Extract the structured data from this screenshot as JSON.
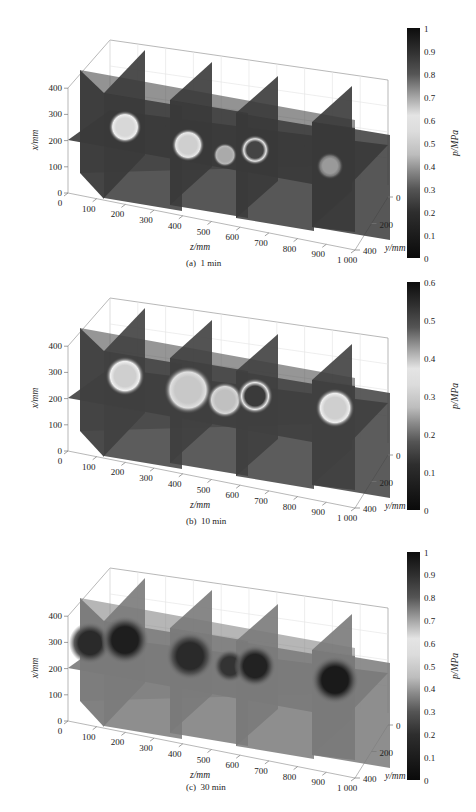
{
  "figure": {
    "panels": [
      {
        "id": "a",
        "caption_label": "(a)",
        "caption_time": "1 min",
        "top": 0,
        "colorbar": {
          "min": 0,
          "max": 1,
          "ticks": [
            "1",
            "0.9",
            "0.8",
            "0.7",
            "0.6",
            "0.5",
            "0.4",
            "0.3",
            "0.2",
            "0.1",
            "0"
          ],
          "label": "p/MPa"
        },
        "base_shade": "#3a3a3a",
        "hotspots": [
          {
            "cx": 125,
            "cy": 127,
            "r": 11,
            "core": "#d8d8d8",
            "rim": "#eeeeee"
          },
          {
            "cx": 188,
            "cy": 145,
            "r": 11,
            "core": "#cfcfcf",
            "rim": "#e8e8e8"
          },
          {
            "cx": 255,
            "cy": 150,
            "r": 10,
            "core": "#444444",
            "rim": "#e6e6e6"
          },
          {
            "cx": 225,
            "cy": 155,
            "r": 8,
            "core": "#aaaaaa",
            "rim": "#b8b8b8"
          },
          {
            "cx": 330,
            "cy": 166,
            "r": 9,
            "core": "#9a9a9a",
            "rim": "#777777"
          }
        ]
      },
      {
        "id": "b",
        "caption_label": "(b)",
        "caption_time": "10 min",
        "top": 270,
        "colorbar": {
          "min": 0,
          "max": 0.6,
          "ticks": [
            "0.6",
            "0.5",
            "0.4",
            "0.3",
            "0.2",
            "0.1",
            "0"
          ],
          "label": "p/MPa"
        },
        "base_shade": "#404040",
        "hotspots": [
          {
            "cx": 125,
            "cy": 118,
            "r": 13,
            "core": "#cfcfcf",
            "rim": "#f0f0f0"
          },
          {
            "cx": 188,
            "cy": 132,
            "r": 16,
            "core": "#c8c8c8",
            "rim": "#e0e0e0"
          },
          {
            "cx": 225,
            "cy": 142,
            "r": 12,
            "core": "#c0c0c0",
            "rim": "#d8d8d8"
          },
          {
            "cx": 255,
            "cy": 138,
            "r": 12,
            "core": "#3a3a3a",
            "rim": "#e8e8e8"
          },
          {
            "cx": 335,
            "cy": 150,
            "r": 13,
            "core": "#cfcfcf",
            "rim": "#eeeeee"
          }
        ]
      },
      {
        "id": "c",
        "caption_label": "(c)",
        "caption_time": "30 min",
        "top": 540,
        "colorbar": {
          "min": 0,
          "max": 1,
          "ticks": [
            "1",
            "0.9",
            "0.8",
            "0.7",
            "0.6",
            "0.5",
            "0.4",
            "0.3",
            "0.2",
            "0.1",
            "0"
          ],
          "label": "p/MPa"
        },
        "base_shade": "#7a7a7a",
        "hotspots": [
          {
            "cx": 90,
            "cy": 115,
            "r": 14,
            "core": "#2a2a2a",
            "rim": "#5a5a5a"
          },
          {
            "cx": 125,
            "cy": 112,
            "r": 16,
            "core": "#1e1e1e",
            "rim": "#555555"
          },
          {
            "cx": 190,
            "cy": 128,
            "r": 16,
            "core": "#2a2a2a",
            "rim": "#555555"
          },
          {
            "cx": 230,
            "cy": 138,
            "r": 11,
            "core": "#333333",
            "rim": "#5a5a5a"
          },
          {
            "cx": 255,
            "cy": 138,
            "r": 14,
            "core": "#222222",
            "rim": "#555555"
          },
          {
            "cx": 335,
            "cy": 152,
            "r": 16,
            "core": "#1a1a1a",
            "rim": "#555555"
          }
        ]
      }
    ],
    "axes": {
      "vertical_label": "x/mm",
      "vertical_ticks": [
        "0",
        "100",
        "200",
        "300",
        "400"
      ],
      "depth_label": "z/mm",
      "depth_ticks": [
        "0",
        "100",
        "200",
        "300",
        "400",
        "500",
        "600",
        "700",
        "800",
        "900",
        "1 000"
      ],
      "lateral_label": "y/mm",
      "lateral_ticks": [
        "0",
        "200",
        "400"
      ]
    }
  },
  "chart_data": [
    {
      "type": "heatmap",
      "title": "(a) 1 min",
      "subtype": "3D slice plot (volumetric pressure field)",
      "axes": {
        "x": {
          "label": "x/mm",
          "range": [
            0,
            400
          ],
          "ticks": [
            0,
            100,
            200,
            300,
            400
          ]
        },
        "z": {
          "label": "z/mm",
          "range": [
            0,
            1000
          ],
          "ticks": [
            0,
            100,
            200,
            300,
            400,
            500,
            600,
            700,
            800,
            900,
            1000
          ]
        },
        "y": {
          "label": "y/mm",
          "range": [
            0,
            400
          ],
          "ticks": [
            0,
            200,
            400
          ]
        }
      },
      "colorbar": {
        "label": "p/MPa",
        "range": [
          0,
          1
        ],
        "ticks": [
          0,
          0.1,
          0.2,
          0.3,
          0.4,
          0.5,
          0.6,
          0.7,
          0.8,
          0.9,
          1
        ]
      },
      "slices": {
        "z_planes_mm": [
          0,
          250,
          500,
          750,
          1000
        ],
        "x_plane_mm": 200
      },
      "features": [
        {
          "z_mm": 250,
          "x_mm": 220,
          "p_MPa": 0.6,
          "note": "bright injection hotspot"
        },
        {
          "z_mm": 500,
          "x_mm": 180,
          "p_MPa": 0.6,
          "note": "bright injection hotspot"
        },
        {
          "z_mm": 750,
          "x_mm": 150,
          "p_MPa": 0.55,
          "note": "ring-shaped hotspot with dark high-pressure core (~1.0)"
        },
        {
          "z_mm": 1000,
          "x_mm": 100,
          "p_MPa": 0.4,
          "note": "weaker hotspot"
        }
      ],
      "background_p_MPa": 0.25
    },
    {
      "type": "heatmap",
      "title": "(b) 10 min",
      "subtype": "3D slice plot (volumetric pressure field)",
      "axes": {
        "x": {
          "label": "x/mm",
          "range": [
            0,
            400
          ],
          "ticks": [
            0,
            100,
            200,
            300,
            400
          ]
        },
        "z": {
          "label": "z/mm",
          "range": [
            0,
            1000
          ],
          "ticks": [
            0,
            100,
            200,
            300,
            400,
            500,
            600,
            700,
            800,
            900,
            1000
          ]
        },
        "y": {
          "label": "y/mm",
          "range": [
            0,
            400
          ],
          "ticks": [
            0,
            200,
            400
          ]
        }
      },
      "colorbar": {
        "label": "p/MPa",
        "range": [
          0,
          0.6
        ],
        "ticks": [
          0,
          0.1,
          0.2,
          0.3,
          0.4,
          0.5,
          0.6
        ]
      },
      "slices": {
        "z_planes_mm": [
          0,
          250,
          500,
          750,
          1000
        ],
        "x_plane_mm": 200
      },
      "features": [
        {
          "z_mm": 250,
          "x_mm": 230,
          "p_MPa": 0.33,
          "note": "bright hotspot"
        },
        {
          "z_mm": 500,
          "x_mm": 200,
          "p_MPa": 0.33,
          "note": "extended bright region merging toward z=700"
        },
        {
          "z_mm": 750,
          "x_mm": 170,
          "p_MPa": 0.33,
          "note": "ring-shaped hotspot with dark core"
        },
        {
          "z_mm": 1000,
          "x_mm": 140,
          "p_MPa": 0.33,
          "note": "bright hotspot"
        }
      ],
      "background_p_MPa": 0.15
    },
    {
      "type": "heatmap",
      "title": "(c) 30 min",
      "subtype": "3D slice plot (volumetric pressure field)",
      "axes": {
        "x": {
          "label": "x/mm",
          "range": [
            0,
            400
          ],
          "ticks": [
            0,
            100,
            200,
            300,
            400
          ]
        },
        "z": {
          "label": "z/mm",
          "range": [
            0,
            1000
          ],
          "ticks": [
            0,
            100,
            200,
            300,
            400,
            500,
            600,
            700,
            800,
            900,
            1000
          ]
        },
        "y": {
          "label": "y/mm",
          "range": [
            0,
            400
          ],
          "ticks": [
            0,
            200,
            400
          ]
        }
      },
      "colorbar": {
        "label": "p/MPa",
        "range": [
          0,
          1
        ],
        "ticks": [
          0,
          0.1,
          0.2,
          0.3,
          0.4,
          0.5,
          0.6,
          0.7,
          0.8,
          0.9,
          1
        ]
      },
      "slices": {
        "z_planes_mm": [
          0,
          250,
          500,
          750,
          1000
        ],
        "x_plane_mm": 200
      },
      "features": [
        {
          "z_mm": 250,
          "x_mm": 230,
          "p_MPa": 0.2,
          "note": "dark low-pressure zone"
        },
        {
          "z_mm": 500,
          "x_mm": 190,
          "p_MPa": 0.2,
          "note": "dark zone"
        },
        {
          "z_mm": 750,
          "x_mm": 170,
          "p_MPa": 0.2,
          "note": "dark zone"
        },
        {
          "z_mm": 1000,
          "x_mm": 130,
          "p_MPa": 0.15,
          "note": "dark zone"
        }
      ],
      "background_p_MPa": 0.35
    }
  ]
}
